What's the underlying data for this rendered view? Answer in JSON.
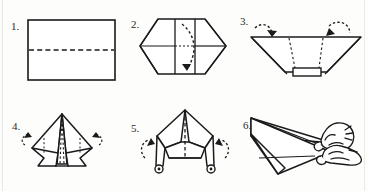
{
  "document": {
    "title": "Paper Airplane Folding Instructions",
    "type": "origami-instruction-diagram",
    "columns": 3,
    "rows": 2,
    "ink_color": "#1a1a1a",
    "paper_color": "#fdfdfc",
    "fold_line_style": "dashed",
    "arrow_style": "dotted-curved"
  },
  "steps": [
    {
      "number": "1.",
      "name": "fold-rectangle-in-half",
      "shape": "rectangle",
      "description": "Flat rectangular sheet of paper with a horizontal dashed fold line across the middle.",
      "fold_lines": 1,
      "arrows": 0
    },
    {
      "number": "2.",
      "name": "fold-corners-to-center",
      "shape": "hexagon-with-center-band",
      "description": "Hexagonal folded form with a vertical center band and one curved dotted arrow sweeping downward.",
      "fold_lines": 2,
      "arrows": 1
    },
    {
      "number": "3.",
      "name": "fold-top-corners-down",
      "shape": "wide-trapezoid-v",
      "description": "Wide V-shaped trapezoid with two vertical dotted fold lines and two curved arrows pointing inward from the top corners.",
      "fold_lines": 2,
      "arrows": 2
    },
    {
      "number": "4.",
      "name": "fold-side-flaps-back",
      "shape": "kite-with-center-spine",
      "description": "Kite form with a narrow center spine triangle, dotted fold lines, and small curved arrows at each side.",
      "fold_lines": 2,
      "arrows": 2
    },
    {
      "number": "5.",
      "name": "fold-wings-down",
      "shape": "twin-leg-form",
      "description": "Form with two downward legs ending in small circles, a dashed center line, and curved arrows rotating the wings.",
      "fold_lines": 1,
      "arrows": 2
    },
    {
      "number": "6.",
      "name": "finished-airplane-in-hands",
      "shape": "dart-airplane",
      "description": "Completed dart paper airplane held by two hands at the tail, ready to launch.",
      "fold_lines": 0,
      "arrows": 0
    }
  ]
}
